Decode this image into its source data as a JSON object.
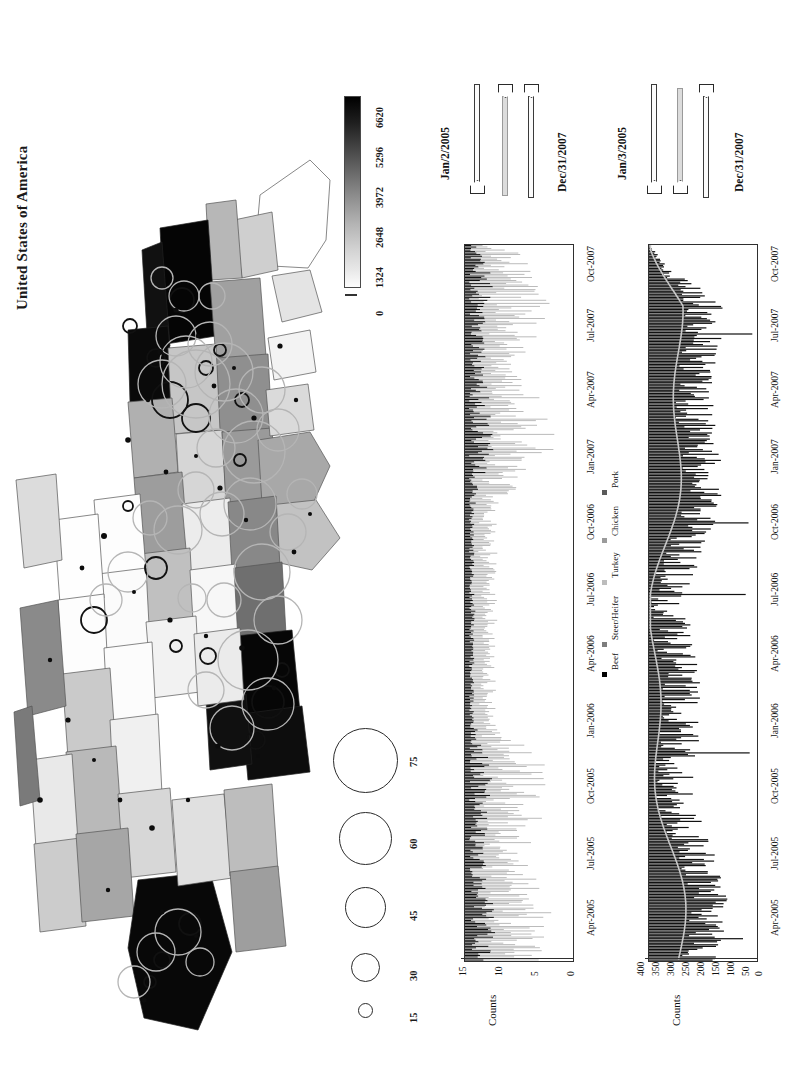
{
  "figure": {
    "orientation": "rotated-90-ccw",
    "map_title": "United States of America"
  },
  "map": {
    "title": "United States of America",
    "colorbar": {
      "name": "choropleth-colorbar",
      "labels": [
        "0",
        "1324",
        "2648",
        "3972",
        "5296",
        "6620"
      ],
      "min": 0,
      "max": 6620,
      "step": 1324,
      "low_color": "#ffffff",
      "high_color": "#000000"
    },
    "bubble_legend": {
      "name": "bubble-size-legend",
      "labels": [
        "15",
        "30",
        "45",
        "60",
        "75"
      ],
      "values": [
        15,
        30,
        45,
        60,
        75
      ]
    }
  },
  "sliders": {
    "group1": {
      "name": "date-range-slider-top",
      "start_label": "Jan/2/2005",
      "end_label": "Dec/31/2007"
    },
    "group2": {
      "name": "date-range-slider-bottom",
      "start_label": "Jan/3/2005",
      "end_label": "Dec/31/2007"
    }
  },
  "chart_data": [
    {
      "id": "chart-top",
      "type": "bar",
      "title": "",
      "xlabel": "",
      "ylabel": "Counts",
      "ylim": [
        0,
        15
      ],
      "yticks": [
        0,
        5,
        10,
        15
      ],
      "ytick_labels": [
        "0",
        "5",
        "10",
        "15"
      ],
      "xtick_labels": [
        "Apr-2005",
        "Jul-2005",
        "Oct-2005",
        "Jan-2006",
        "Apr-2006",
        "Jul-2006",
        "Oct-2006",
        "Jan-2007",
        "Apr-2007",
        "Jul-2007",
        "Oct-2007"
      ],
      "grid": false,
      "legend_position": "below-axis",
      "legend": [
        {
          "label": "Beef",
          "color": "#000000"
        },
        {
          "label": "Steer/Heifer",
          "color": "#7d7d7d"
        },
        {
          "label": "Turkey",
          "color": "#bcbcbc"
        },
        {
          "label": "Chicken",
          "color": "#9b9b9b"
        },
        {
          "label": "Pork",
          "color": "#5a5a5a"
        }
      ],
      "series": [
        {
          "name": "Beef",
          "color": "#000000",
          "note": "dark stacked component, daily counts mostly 1-6"
        },
        {
          "name": "Steer/Heifer",
          "color": "#7d7d7d",
          "note": "mid-grey component, spikes to ~12"
        },
        {
          "name": "Turkey",
          "color": "#bcbcbc",
          "note": "light component"
        },
        {
          "name": "Chicken",
          "color": "#9b9b9b",
          "note": "light-mid component"
        },
        {
          "name": "Pork",
          "color": "#5a5a5a",
          "note": "small component"
        }
      ],
      "x_range": [
        "Jan/2/2005",
        "Dec/31/2007"
      ],
      "peak_value": 15
    },
    {
      "id": "chart-bottom",
      "type": "bar",
      "title": "",
      "xlabel": "Date",
      "ylabel": "Counts",
      "ylim": [
        0,
        400
      ],
      "yticks": [
        0,
        50,
        100,
        150,
        200,
        250,
        300,
        350,
        400
      ],
      "ytick_labels": [
        "0",
        "50",
        "100",
        "150",
        "200",
        "250",
        "300",
        "350",
        "400"
      ],
      "xtick_labels": [
        "Apr-2005",
        "Jul-2005",
        "Oct-2005",
        "Jan-2006",
        "Apr-2006",
        "Jul-2006",
        "Oct-2006",
        "Jan-2007",
        "Apr-2007",
        "Jul-2007",
        "Oct-2007"
      ],
      "grid": false,
      "legend_position": "none",
      "series": [
        {
          "name": "Daily counts",
          "color": "#111111",
          "note": "dense daily spikes, typical 50-250, max spikes ~400"
        },
        {
          "name": "Smoothed trend",
          "color": "#c9c9c9",
          "note": "light grey running-mean overlay ~50-160"
        }
      ],
      "x_range": [
        "Jan/3/2005",
        "Dec/31/2007"
      ],
      "peak_value": 400
    }
  ]
}
